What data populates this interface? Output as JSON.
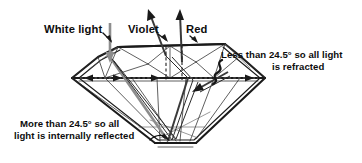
{
  "figure": {
    "background_color": "#ffffff",
    "ink_color": "#1a1a1a"
  },
  "labels": {
    "white_light": "White light",
    "violet": "Violet",
    "red": "Red"
  },
  "annotations": {
    "refracted": {
      "line1": "Less than 24.5° so all light",
      "line2": "is refracted"
    },
    "reflected": {
      "line1": "More than 24.5° so all",
      "line2": "light is internally reflected"
    }
  },
  "physics": {
    "critical_angle": "24.5°",
    "material": "diamond",
    "rays": [
      {
        "name": "white-light-incident-ray",
        "color_name": "white",
        "stroke": "#8d8d8d",
        "direction": "downward"
      },
      {
        "name": "violet-exit-ray",
        "color_name": "violet",
        "stroke": "#3a3a3a",
        "direction": "upward"
      },
      {
        "name": "red-exit-ray",
        "color_name": "red",
        "stroke": "#3a3a3a",
        "direction": "upward"
      }
    ]
  }
}
